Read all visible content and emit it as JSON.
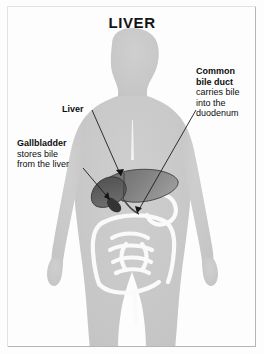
{
  "figure": {
    "title": "LIVER",
    "type": "anatomical-illustration"
  },
  "colors": {
    "background": "#fdfdfd",
    "frame_border": "#b4b4b4",
    "body_silhouette": "#c9c9c9",
    "body_edge": "#bdbdbd",
    "liver_dark": "#565656",
    "liver_mid": "#6e6e6e",
    "liver_light": "#8a8a8a",
    "gallbladder": "#3c3c3c",
    "intestine_outline": "#ffffff",
    "leader_line": "#1a1a1a",
    "text": "#0d0d0d"
  },
  "callouts": [
    {
      "id": "liver",
      "heading": "Liver",
      "body": ""
    },
    {
      "id": "gallbladder",
      "heading": "Gallbladder",
      "body_line_1": "stores bile",
      "body_line_2": "from the liver"
    },
    {
      "id": "bile-duct",
      "heading_line_1": "Common",
      "heading_line_2": "bile duct",
      "body_line_1": "carries bile",
      "body_line_2": "into the",
      "body_line_3": "duodenum"
    }
  ]
}
